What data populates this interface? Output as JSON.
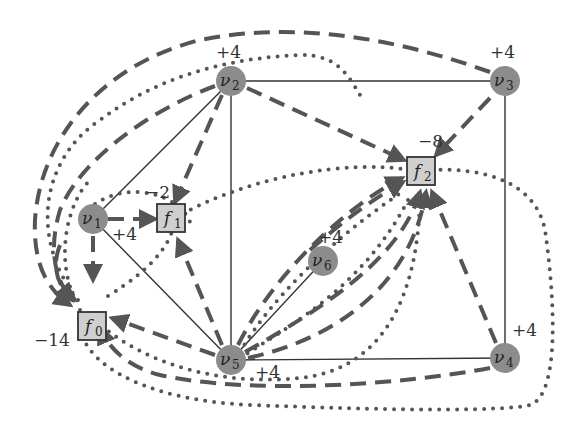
{
  "diagram": {
    "type": "flow-network-graph",
    "colors": {
      "vertex_fill": "#8c8c8c",
      "facility_fill": "#cfcfcf",
      "edge": "#333333",
      "flow": "#555555",
      "background": "#ffffff"
    },
    "vertices": [
      {
        "id": "v1",
        "label": "ν",
        "sub": "1",
        "supply": "+4"
      },
      {
        "id": "v2",
        "label": "ν",
        "sub": "2",
        "supply": "+4"
      },
      {
        "id": "v3",
        "label": "ν",
        "sub": "3",
        "supply": "+4"
      },
      {
        "id": "v4",
        "label": "ν",
        "sub": "4",
        "supply": "+4"
      },
      {
        "id": "v5",
        "label": "ν",
        "sub": "5",
        "supply": "+4"
      },
      {
        "id": "v6",
        "label": "ν",
        "sub": "6",
        "supply": "+4"
      }
    ],
    "facilities": [
      {
        "id": "f0",
        "label": "f",
        "sub": "0",
        "demand": "−14"
      },
      {
        "id": "f1",
        "label": "f",
        "sub": "1",
        "demand": "−2"
      },
      {
        "id": "f2",
        "label": "f",
        "sub": "2",
        "demand": "−8"
      }
    ],
    "solid_edges": [
      [
        "v1",
        "v2"
      ],
      [
        "v1",
        "v5"
      ],
      [
        "v2",
        "v3"
      ],
      [
        "v2",
        "v5"
      ],
      [
        "v3",
        "v4"
      ],
      [
        "v5",
        "v4"
      ],
      [
        "v5",
        "v6"
      ]
    ],
    "dashed_arrows": [
      [
        "v1",
        "f1"
      ],
      [
        "v1",
        "f0"
      ],
      [
        "v2",
        "f1"
      ],
      [
        "v2",
        "f2"
      ],
      [
        "v2",
        "f0"
      ],
      [
        "v3",
        "f2"
      ],
      [
        "v3",
        "f0"
      ],
      [
        "v4",
        "f2"
      ],
      [
        "v4",
        "f0"
      ],
      [
        "v5",
        "f1"
      ],
      [
        "v5",
        "f2"
      ],
      [
        "v5",
        "f0"
      ],
      [
        "v6",
        "f2"
      ]
    ],
    "dotted_paths_count": 9,
    "legend": {
      "solid": "graph edge",
      "dashed": "flow to facility",
      "dotted": "alternative path"
    }
  }
}
